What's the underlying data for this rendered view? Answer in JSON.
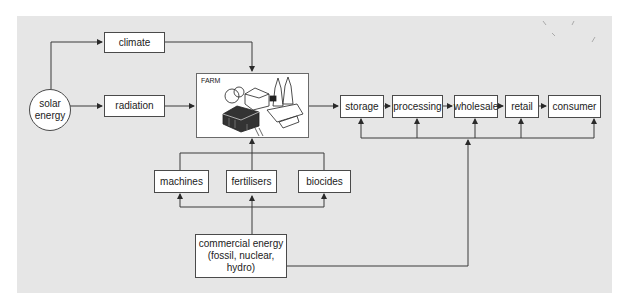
{
  "diagram": {
    "type": "flowchart",
    "nodes": {
      "solar_energy": {
        "line1": "solar",
        "line2": "energy"
      },
      "climate": "climate",
      "radiation": "radiation",
      "farm": "FARM",
      "storage": "storage",
      "processing": "processing",
      "wholesale": "wholesale",
      "retail": "retail",
      "consumer": "consumer",
      "machines": "machines",
      "fertilisers": "fertilisers",
      "biocides": "biocides",
      "commercial_energy": {
        "line1": "commercial energy",
        "line2": "(fossil, nuclear, hydro)"
      }
    },
    "edges": [
      [
        "solar energy",
        "climate"
      ],
      [
        "solar energy",
        "radiation"
      ],
      [
        "climate",
        "FARM"
      ],
      [
        "radiation",
        "FARM"
      ],
      [
        "machines",
        "FARM"
      ],
      [
        "fertilisers",
        "FARM"
      ],
      [
        "biocides",
        "FARM"
      ],
      [
        "FARM",
        "storage"
      ],
      [
        "storage",
        "processing"
      ],
      [
        "processing",
        "wholesale"
      ],
      [
        "wholesale",
        "retail"
      ],
      [
        "retail",
        "consumer"
      ],
      [
        "commercial energy",
        "machines"
      ],
      [
        "commercial energy",
        "fertilisers"
      ],
      [
        "commercial energy",
        "biocides"
      ],
      [
        "commercial energy",
        "storage"
      ],
      [
        "commercial energy",
        "processing"
      ],
      [
        "commercial energy",
        "wholesale"
      ],
      [
        "commercial energy",
        "retail"
      ],
      [
        "commercial energy",
        "consumer"
      ]
    ],
    "colors": {
      "background": "#e6e6e6",
      "box_fill": "#ffffff",
      "stroke": "#3a3a3a"
    }
  }
}
